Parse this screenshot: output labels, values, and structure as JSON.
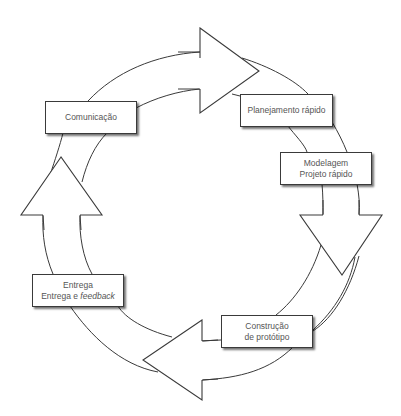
{
  "diagram": {
    "type": "cycle",
    "title": "",
    "stages": [
      {
        "id": "comunicacao",
        "lines": [
          "Comunicação"
        ]
      },
      {
        "id": "planejamento",
        "lines": [
          "Planejamento rápido"
        ]
      },
      {
        "id": "modelagem",
        "lines": [
          "Modelagem",
          "Projeto rápido"
        ]
      },
      {
        "id": "construcao",
        "lines": [
          "Construção",
          "de protótipo"
        ]
      },
      {
        "id": "entrega",
        "lines": [
          "Entrega"
        ],
        "line2_prefix": "Entrega e ",
        "line2_italic": "feedback"
      }
    ],
    "flow": [
      "comunicacao",
      "planejamento",
      "modelagem",
      "construcao",
      "entrega",
      "comunicacao"
    ],
    "arrows": [
      {
        "id": "arrow-right-top",
        "direction": "right"
      },
      {
        "id": "arrow-down-right",
        "direction": "down"
      },
      {
        "id": "arrow-left-bottom",
        "direction": "left"
      },
      {
        "id": "arrow-up-left",
        "direction": "up"
      }
    ],
    "colors": {
      "stroke": "#3a3a3a",
      "text": "#555555",
      "fill": "#ffffff"
    }
  }
}
